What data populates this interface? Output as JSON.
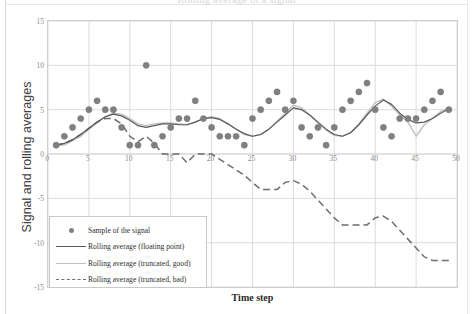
{
  "chart_title": "Rolling average of a signal",
  "axes": {
    "ylabel": "Signal and rolling averages",
    "xlabel": "Time step",
    "yticks": [
      "15",
      "10",
      "5",
      "0",
      "-5",
      "-10",
      "-15"
    ],
    "xticks": [
      "0",
      "5",
      "10",
      "15",
      "20",
      "25",
      "30",
      "35",
      "40",
      "45",
      "50"
    ]
  },
  "legend": {
    "items": [
      {
        "label": "Sample of the signal",
        "key": "marker-dot",
        "color": "#808080"
      },
      {
        "label": "Rolling average (floating point)",
        "key": "solid-line",
        "color": "#595959"
      },
      {
        "label": "Rolling average (truncated, good)",
        "key": "solid-line-light",
        "color": "#c0c0c0"
      },
      {
        "label": "Rolling average (truncated, bad)",
        "key": "dashed-line",
        "color": "#6e6e6e"
      }
    ]
  },
  "chart_data": {
    "type": "scatter",
    "title": "Rolling average of a signal",
    "xlabel": "Time step",
    "ylabel": "Signal and rolling averages",
    "xlim": [
      0,
      50
    ],
    "ylim": [
      -15,
      15
    ],
    "xtick_step": 5,
    "ytick_step": 5,
    "grid": true,
    "legend_position": "lower-left-inside",
    "x": [
      1,
      2,
      3,
      4,
      5,
      6,
      7,
      8,
      9,
      10,
      11,
      12,
      13,
      14,
      15,
      16,
      17,
      18,
      19,
      20,
      21,
      22,
      23,
      24,
      25,
      26,
      27,
      28,
      29,
      30,
      31,
      32,
      33,
      34,
      35,
      36,
      37,
      38,
      39,
      40,
      41,
      42,
      43,
      44,
      45,
      46,
      47,
      48,
      49
    ],
    "series": [
      {
        "name": "Sample of the signal",
        "type": "scatter",
        "color": "#808080",
        "values": [
          1,
          2,
          3,
          4,
          5,
          6,
          5,
          5,
          3,
          1,
          1,
          10,
          1,
          2,
          3,
          4,
          4,
          6,
          4,
          3,
          2,
          2,
          2,
          1,
          4,
          5,
          6,
          7,
          5,
          6,
          3,
          2,
          3,
          1,
          3,
          5,
          6,
          7,
          8,
          5,
          3,
          2,
          4,
          4,
          4,
          5,
          6,
          7,
          5
        ]
      },
      {
        "name": "Rolling average (floating point)",
        "type": "line",
        "color": "#595959",
        "values": [
          1.0,
          1.2,
          1.6,
          2.2,
          2.9,
          3.6,
          4.2,
          4.5,
          4.3,
          3.8,
          3.2,
          3.0,
          3.2,
          3.4,
          3.4,
          3.3,
          3.3,
          3.6,
          4.0,
          4.1,
          3.9,
          3.4,
          2.8,
          2.3,
          2.0,
          2.2,
          2.8,
          3.6,
          4.4,
          5.2,
          5.0,
          4.4,
          3.6,
          2.8,
          2.2,
          2.0,
          2.4,
          3.3,
          4.4,
          5.4,
          6.1,
          5.6,
          4.6,
          3.9,
          3.5,
          3.6,
          4.0,
          4.6,
          5.1
        ]
      },
      {
        "name": "Rolling average (truncated, good)",
        "type": "line",
        "color": "#c0c0c0",
        "values": [
          1.0,
          1.0,
          1.5,
          2.0,
          2.8,
          3.5,
          4.2,
          4.6,
          4.5,
          4.0,
          3.4,
          3.2,
          3.4,
          3.5,
          3.5,
          3.4,
          3.3,
          3.6,
          4.0,
          4.2,
          4.0,
          3.4,
          2.8,
          2.2,
          2.0,
          2.2,
          2.8,
          3.7,
          4.6,
          5.5,
          5.2,
          4.4,
          3.5,
          2.7,
          2.1,
          2.0,
          2.4,
          3.4,
          4.6,
          5.8,
          6.2,
          5.4,
          4.4,
          3.6,
          2.0,
          3.3,
          4.0,
          4.8,
          5.2
        ]
      },
      {
        "name": "Rolling average (truncated, bad)",
        "type": "line-dashed",
        "color": "#6e6e6e",
        "values": [
          1.0,
          1.2,
          1.6,
          2.2,
          2.9,
          3.6,
          4.0,
          4.0,
          3.4,
          2.0,
          1.4,
          2.0,
          1.2,
          0.0,
          0.0,
          0.0,
          -1.0,
          0.0,
          0.0,
          0.0,
          -0.6,
          -1.2,
          -1.8,
          -2.4,
          -3.2,
          -4.0,
          -4.0,
          -4.0,
          -3.2,
          -3.0,
          -3.4,
          -4.2,
          -5.2,
          -6.2,
          -7.2,
          -8.0,
          -8.0,
          -8.0,
          -8.0,
          -7.2,
          -7.0,
          -7.6,
          -8.6,
          -9.6,
          -10.6,
          -11.6,
          -12.0,
          -12.0,
          -12.0
        ]
      }
    ]
  }
}
